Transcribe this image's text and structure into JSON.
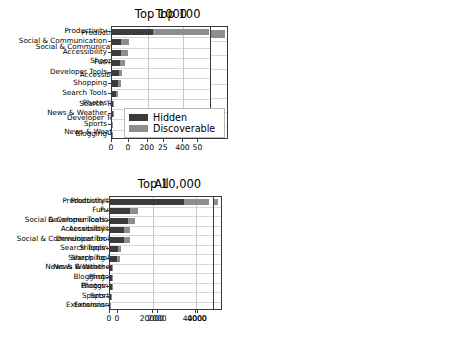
{
  "figure": {
    "width": 466,
    "height": 340,
    "background": "#ffffff"
  },
  "legend": {
    "position": "center-left-of-top-left-panel",
    "entries": [
      {
        "label": "Hidden",
        "color": "#3b3b3b"
      },
      {
        "label": "Discoverable",
        "color": "#8e8e8e"
      }
    ]
  },
  "chart_data": [
    {
      "type": "bar",
      "orientation": "horizontal",
      "stacked": true,
      "title": "Top 100",
      "xlabel": "",
      "ylabel": "",
      "xlim": [
        0,
        72
      ],
      "xticks": [
        0,
        25,
        50
      ],
      "xticklabels": [
        "0",
        "25",
        "50"
      ],
      "grid": true,
      "legend": [
        "Hidden",
        "Discoverable"
      ],
      "categories": [
        "Productivity",
        "Social & Communication",
        "Shopping",
        "Accessibility",
        "Fun",
        "Search Tools",
        "Developer Tools",
        "News & Weather"
      ],
      "series": [
        {
          "name": "Hidden",
          "color": "#3b3b3b",
          "values": [
            24,
            7,
            5,
            5,
            4,
            1,
            1,
            0
          ]
        },
        {
          "name": "Discoverable",
          "color": "#8e8e8e",
          "values": [
            45,
            2,
            1,
            2,
            1,
            0,
            1,
            1
          ]
        }
      ],
      "totals": [
        69,
        9,
        6,
        7,
        5,
        1,
        2,
        1
      ]
    },
    {
      "type": "bar",
      "orientation": "horizontal",
      "stacked": true,
      "title": "Top 1000",
      "xlabel": "",
      "ylabel": "",
      "xlim": [
        0,
        560
      ],
      "xticks": [
        0,
        200,
        400
      ],
      "xticklabels": [
        "0",
        "200",
        "400"
      ],
      "grid": true,
      "legend": [
        "Hidden",
        "Discoverable"
      ],
      "categories": [
        "Productivity",
        "Social & Communication",
        "Accessibility",
        "Fun",
        "Developer Tools",
        "Shopping",
        "Search Tools",
        "Photos",
        "News & Weather",
        "Sports",
        "Blogging"
      ],
      "series": [
        {
          "name": "Hidden",
          "color": "#3b3b3b",
          "values": [
            232,
            52,
            48,
            44,
            38,
            34,
            24,
            8,
            7,
            2,
            1
          ]
        },
        {
          "name": "Discoverable",
          "color": "#8e8e8e",
          "values": [
            310,
            45,
            43,
            29,
            20,
            18,
            8,
            3,
            3,
            1,
            1
          ]
        }
      ],
      "totals": [
        542,
        97,
        91,
        73,
        58,
        52,
        32,
        11,
        10,
        3,
        2
      ]
    },
    {
      "type": "bar",
      "orientation": "horizontal",
      "stacked": true,
      "title": "Top 10,000",
      "xlabel": "",
      "ylabel": "",
      "xlim": [
        0,
        5250
      ],
      "xticks": [
        0,
        2000,
        4000
      ],
      "xticklabels": [
        "0",
        "2000",
        "4000"
      ],
      "grid": true,
      "legend": [
        "Hidden",
        "Discoverable"
      ],
      "categories": [
        "Productivity",
        "Fun",
        "Social & Communication",
        "Accessibility",
        "Developer Tools",
        "Shopping",
        "Search Tools",
        "News & Weather",
        "Photos",
        "Blogging",
        "Sports",
        "Extensions"
      ],
      "series": [
        {
          "name": "Hidden",
          "color": "#3b3b3b",
          "values": [
            3020,
            620,
            600,
            610,
            570,
            290,
            290,
            80,
            70,
            20,
            15,
            5
          ]
        },
        {
          "name": "Discoverable",
          "color": "#8e8e8e",
          "values": [
            1980,
            430,
            340,
            270,
            220,
            130,
            100,
            30,
            25,
            10,
            8,
            3
          ]
        }
      ],
      "totals": [
        5000,
        1050,
        940,
        880,
        790,
        420,
        390,
        110,
        95,
        30,
        23,
        8
      ]
    },
    {
      "type": "bar",
      "orientation": "horizontal",
      "stacked": true,
      "title": "All",
      "xlabel": "",
      "ylabel": "",
      "xlim": [
        0,
        49000
      ],
      "xticks": [
        0,
        20000,
        40000
      ],
      "xticklabels": [
        "0",
        "20000",
        "40000"
      ],
      "grid": true,
      "legend": [
        "Hidden",
        "Discoverable"
      ],
      "categories": [
        "Productivity",
        "Fun",
        "Developer Tools",
        "Accessibility",
        "Social & Communication",
        "Search Tools",
        "Shopping",
        "News & Weather",
        "Blogging",
        "Photos",
        "Sports",
        "Extensions"
      ],
      "series": [
        {
          "name": "Hidden",
          "color": "#3b3b3b",
          "values": [
            34500,
            9200,
            8400,
            6600,
            6300,
            3800,
            3400,
            1100,
            1000,
            700,
            500,
            120
          ]
        },
        {
          "name": "Discoverable",
          "color": "#8e8e8e",
          "values": [
            11500,
            4000,
            3200,
            2900,
            2800,
            1500,
            1400,
            400,
            350,
            250,
            180,
            50
          ]
        }
      ],
      "totals": [
        46000,
        13200,
        11600,
        9500,
        9100,
        5300,
        4800,
        1500,
        1350,
        950,
        680,
        170
      ]
    }
  ]
}
